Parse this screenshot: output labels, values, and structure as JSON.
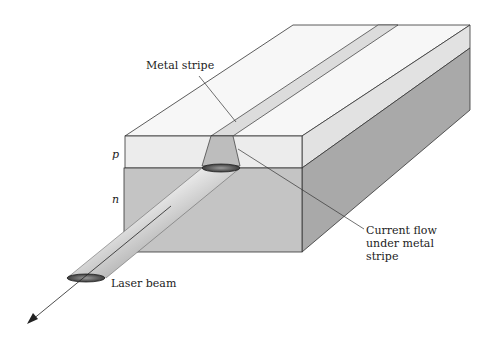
{
  "figure": {
    "labels": {
      "metal_stripe": "Metal stripe",
      "p_layer": "p",
      "n_layer": "n",
      "current_flow_line1": "Current flow",
      "current_flow_line2": "under metal",
      "current_flow_line3": "stripe",
      "laser_beam": "Laser beam"
    },
    "colors": {
      "top_face": "#f7f7f7",
      "p_front": "#ececec",
      "n_front": "#c4c4c4",
      "side_p": "#e2e2e2",
      "side_n": "#a9a9a9",
      "stripe": "#dcdcdc",
      "outline": "#333333"
    }
  }
}
